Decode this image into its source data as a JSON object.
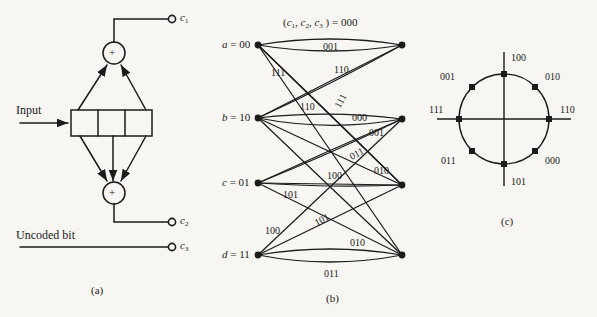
{
  "figure": {
    "background": "#f7f6f2",
    "ink": "#1b1b1b",
    "width": 597,
    "height": 317
  },
  "panel_a": {
    "caption": "(a)",
    "input_label": "Input",
    "uncoded_label": "Uncoded bit",
    "adder_symbol": "+",
    "register_cells": 3,
    "outputs": [
      {
        "name": "c1",
        "base": "c",
        "sub": "1"
      },
      {
        "name": "c2",
        "base": "c",
        "sub": "2"
      },
      {
        "name": "c3",
        "base": "c",
        "sub": "3"
      }
    ],
    "top_adder_taps": 2,
    "bottom_adder_taps": 3
  },
  "panel_b": {
    "caption": "(b)",
    "title_prefix": "(",
    "title": "(c1, c2, c3) = 000",
    "title_parts": {
      "open": "(",
      "c1": "c",
      "c1sub": "1",
      "sep1": ", ",
      "c2": "c",
      "c2sub": "2",
      "sep2": ", ",
      "c3": "c",
      "c3sub": "3",
      "close": " ) = ",
      "value": "000"
    },
    "states": [
      {
        "id": "a",
        "letter": "a",
        "bits": "00",
        "label": "a = 00"
      },
      {
        "id": "b",
        "letter": "b",
        "bits": "10",
        "label": "b = 10"
      },
      {
        "id": "c",
        "letter": "c",
        "bits": "01",
        "label": "c = 01"
      },
      {
        "id": "d",
        "letter": "d",
        "bits": "11",
        "label": "d = 11"
      }
    ],
    "edge_labels": [
      {
        "text": "001",
        "from": "a",
        "to": "a",
        "rotate": 0
      },
      {
        "text": "111",
        "from": "a",
        "to": "c",
        "rotate": 0
      },
      {
        "text": "110",
        "from": "a",
        "to": "c",
        "rotate": 0
      },
      {
        "text": "110",
        "from": "b",
        "to": "a",
        "rotate": 0
      },
      {
        "text": "111",
        "from": "b",
        "to": "a",
        "rotate": -62
      },
      {
        "text": "000",
        "from": "b",
        "to": "b",
        "rotate": 0
      },
      {
        "text": "001",
        "from": "b",
        "to": "b",
        "rotate": 0
      },
      {
        "text": "011",
        "from": "c",
        "to": "c",
        "rotate": -28
      },
      {
        "text": "010",
        "from": "c",
        "to": "c",
        "rotate": 0
      },
      {
        "text": "100",
        "from": "c",
        "to": "c",
        "rotate": 0
      },
      {
        "text": "101",
        "from": "c",
        "to": "d",
        "rotate": 0
      },
      {
        "text": "101",
        "from": "d",
        "to": "c",
        "rotate": -27
      },
      {
        "text": "100",
        "from": "d",
        "to": "b",
        "rotate": 0
      },
      {
        "text": "010",
        "from": "d",
        "to": "d",
        "rotate": 0
      },
      {
        "text": "011",
        "from": "d",
        "to": "d",
        "rotate": 0
      }
    ]
  },
  "panel_c": {
    "caption": "(c)",
    "type": "8-PSK constellation",
    "points": [
      {
        "label": "100",
        "angle_deg": 90
      },
      {
        "label": "010",
        "angle_deg": 45
      },
      {
        "label": "110",
        "angle_deg": 0
      },
      {
        "label": "000",
        "angle_deg": -45
      },
      {
        "label": "101",
        "angle_deg": -90
      },
      {
        "label": "011",
        "angle_deg": -135
      },
      {
        "label": "111",
        "angle_deg": 180
      },
      {
        "label": "001",
        "angle_deg": 135
      }
    ]
  }
}
